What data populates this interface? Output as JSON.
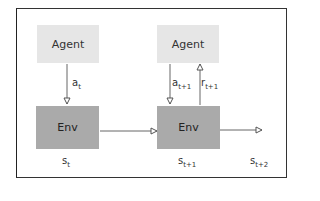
{
  "diagram": {
    "nodes": [
      {
        "id": "agent-t",
        "label": "Agent"
      },
      {
        "id": "env-t",
        "label": "Env"
      },
      {
        "id": "agent-t1",
        "label": "Agent"
      },
      {
        "id": "env-t1",
        "label": "Env"
      }
    ],
    "labels": {
      "a_t": {
        "base": "a",
        "sub": "t"
      },
      "a_t1": {
        "base": "a",
        "sub": "t+1"
      },
      "r_t1": {
        "base": "r",
        "sub": "t+1"
      },
      "s_t": {
        "base": "s",
        "sub": "t"
      },
      "s_t1": {
        "base": "s",
        "sub": "t+1"
      },
      "s_t2": {
        "base": "s",
        "sub": "t+2"
      }
    },
    "edges": [
      {
        "from": "agent-t",
        "to": "env-t",
        "label": "a_t"
      },
      {
        "from": "env-t",
        "to": "env-t1"
      },
      {
        "from": "agent-t1",
        "to": "env-t1",
        "label": "a_t+1"
      },
      {
        "from": "env-t1",
        "to": "agent-t1",
        "label": "r_t+1"
      },
      {
        "from": "env-t1",
        "to": "next",
        "label": ""
      }
    ],
    "colors": {
      "agent_fill": "#e6e6e6",
      "env_fill": "#aaaaaa",
      "line": "#555555",
      "border": "#333333"
    }
  }
}
